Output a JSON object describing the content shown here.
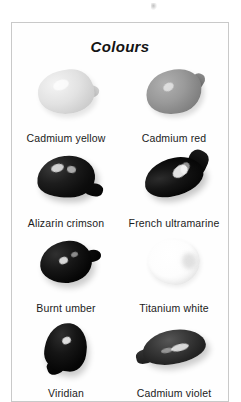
{
  "plate": {
    "title": "Colours",
    "swatches": [
      {
        "label": "Cadmium yellow",
        "icon": "paint-blob-icon",
        "tone": "#dcdcdc"
      },
      {
        "label": "Cadmium red",
        "icon": "paint-blob-icon",
        "tone": "#8f8f8f"
      },
      {
        "label": "Alizarin crimson",
        "icon": "paint-blob-icon",
        "tone": "#101010"
      },
      {
        "label": "French ultramarine",
        "icon": "paint-blob-icon",
        "tone": "#0b0b0b"
      },
      {
        "label": "Burnt umber",
        "icon": "paint-blob-icon",
        "tone": "#0a0a0a"
      },
      {
        "label": "Titanium white",
        "icon": "paint-blob-icon",
        "tone": "#fbfbfb"
      },
      {
        "label": "Viridian",
        "icon": "paint-blob-icon",
        "tone": "#0a0a0a"
      },
      {
        "label": "Cadmium violet",
        "icon": "paint-blob-icon",
        "tone": "#2e2e2e"
      }
    ]
  }
}
